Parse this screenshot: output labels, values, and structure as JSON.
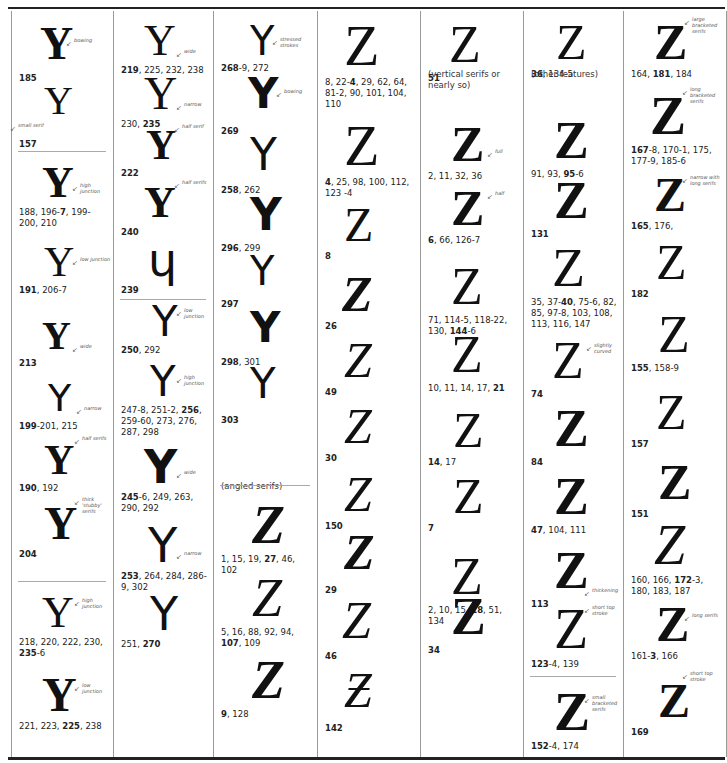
{
  "page": {
    "background": "#ffffff",
    "rule_color": "#222222",
    "column_divider_color": "#9a9a9a"
  },
  "columns": [
    {
      "id": "col1",
      "letter": "Y",
      "entries": [
        {
          "glyph": "Y",
          "note": "bowing",
          "refs": "**185**"
        },
        {
          "glyph": "Y",
          "note": "small serif",
          "refs": "**157**"
        },
        {
          "glyph": "Y",
          "note": "high junction",
          "refs": "188, 196-**7**, 199-200, 210"
        },
        {
          "glyph": "Y",
          "note": "low junction",
          "refs": "**191**, 206-7"
        },
        {
          "glyph": "Y",
          "note": "wide",
          "refs": "**213**"
        },
        {
          "glyph": "Y",
          "note": "narrow",
          "refs": "**199**-201, 215"
        },
        {
          "glyph": "Y",
          "note": "half serifs",
          "refs": "**190**, 192"
        },
        {
          "glyph": "Y",
          "note": "thick 'stubby' serifs",
          "refs": "**204**"
        },
        {
          "glyph": "Y",
          "note": "high junction",
          "refs": "218, 220, 222, 230, **235**-6"
        },
        {
          "glyph": "Y",
          "note": "low junction",
          "refs": "221, 223, **225**, 238"
        }
      ]
    },
    {
      "id": "col2",
      "letter": "Y",
      "entries": [
        {
          "glyph": "Y",
          "note": "wide",
          "refs": "**219**, 225, 232, 238"
        },
        {
          "glyph": "Y",
          "note": "narrow",
          "refs": "230, **235**"
        },
        {
          "glyph": "Y",
          "note": "half serif",
          "refs": "**222**"
        },
        {
          "glyph": "Y",
          "note": "half serifs",
          "refs": "**240**"
        },
        {
          "glyph": "ɥ",
          "note": "",
          "refs": "**239**"
        },
        {
          "glyph": "Y",
          "note": "low junction",
          "refs": "**250**, 292"
        },
        {
          "glyph": "Y",
          "note": "high junction",
          "refs": "247-8, 251-2, **256**, 259-60, 273, 276, 287, 298"
        },
        {
          "glyph": "Y",
          "note": "wide",
          "refs": "**245**-6, 249, 263, 290, 292"
        },
        {
          "glyph": "Y",
          "note": "narrow",
          "refs": "**253**, 264, 284, 286-9, 302"
        },
        {
          "glyph": "Y",
          "note": "",
          "refs": "251, **270**"
        }
      ]
    },
    {
      "id": "col3",
      "letter": "Y/Z",
      "entries": [
        {
          "glyph": "Y",
          "note": "stressed strokes",
          "refs": "**268**-9, 272"
        },
        {
          "glyph": "Y",
          "note": "bowing",
          "refs": "**269**"
        },
        {
          "glyph": "Y",
          "note": "",
          "refs": "**258**, 262"
        },
        {
          "glyph": "Y",
          "note": "",
          "refs": "**296**, 299"
        },
        {
          "glyph": "Y",
          "note": "",
          "refs": "**297**"
        },
        {
          "glyph": "Y",
          "note": "",
          "refs": "**298**, 301"
        },
        {
          "glyph": "Y",
          "note": "",
          "refs": "**303**"
        }
      ],
      "section_caption": "(angled serifs)",
      "entries_after": [
        {
          "glyph": "Z",
          "note": "",
          "refs": "1, 15, 19, **27**, 46, 102"
        },
        {
          "glyph": "Z",
          "note": "",
          "refs": "5, 16, 88, 92, 94, **107**, 109"
        },
        {
          "glyph": "Z",
          "note": "",
          "refs": "**9**, 128"
        }
      ]
    },
    {
      "id": "col4",
      "letter": "Z",
      "entries": [
        {
          "glyph": "Z",
          "note": "",
          "refs": "8, 22-**4**, 29, 62, 64, 81-2, 90, 101, 104, 110"
        },
        {
          "glyph": "Z",
          "note": "",
          "refs": "**4**, 25, 98, 100, 112, 123 -4"
        },
        {
          "glyph": "Z",
          "note": "",
          "refs": "**8**"
        },
        {
          "glyph": "Z",
          "note": "",
          "refs": "**26**"
        },
        {
          "glyph": "Z",
          "note": "",
          "refs": "**49**"
        },
        {
          "glyph": "Z",
          "note": "",
          "refs": "**30**"
        },
        {
          "glyph": "Z",
          "note": "",
          "refs": "**150**"
        },
        {
          "glyph": "Z",
          "note": "",
          "refs": "**29**"
        },
        {
          "glyph": "Z",
          "note": "",
          "refs": "**46**"
        },
        {
          "glyph": "Ƶ",
          "note": "",
          "refs": "**142**"
        }
      ]
    },
    {
      "id": "col5",
      "letter": "Z",
      "entries": [
        {
          "glyph": "Z",
          "note": "",
          "refs": "**51**"
        }
      ],
      "section_caption": "(vertical serifs or nearly so)",
      "entries_after": [
        {
          "glyph": "Z",
          "note": "full",
          "refs": "2, 11, 32, 36"
        },
        {
          "glyph": "Z",
          "note": "half",
          "refs": "**6**, 66, 126-7"
        },
        {
          "glyph": "Z",
          "note": "",
          "refs": "71, 114-5, 118-22, 130, **144**-6"
        },
        {
          "glyph": "Z",
          "note": "",
          "refs": "10, 11, 14, 17, **21**"
        },
        {
          "glyph": "Z",
          "note": "",
          "refs": "**14**, 17"
        },
        {
          "glyph": "Z",
          "note": "",
          "refs": "**7**"
        },
        {
          "glyph": "Z",
          "note": "",
          "refs": "2, 10, 15, **18**, 51, 134"
        },
        {
          "glyph": "Z",
          "note": "",
          "refs": "**34**"
        }
      ]
    },
    {
      "id": "col6",
      "letter": "Z",
      "entries": [
        {
          "glyph": "Z",
          "note": "",
          "refs": "**36**, 134-5"
        }
      ],
      "section_caption": "(other features)",
      "entries_after": [
        {
          "glyph": "Z",
          "note": "",
          "refs": "91, 93, **95**-6"
        },
        {
          "glyph": "Z",
          "note": "",
          "refs": "**131**"
        },
        {
          "glyph": "Z",
          "note": "",
          "refs": "35, 37-**40**, 75-6, 82, 85, 97-8, 103, 108, 113, 116, 147"
        },
        {
          "glyph": "Z",
          "note": "slightly curved",
          "refs": "**74**"
        },
        {
          "glyph": "Z",
          "note": "",
          "refs": "**84**"
        },
        {
          "glyph": "Z",
          "note": "",
          "refs": "**47**, 104, 111"
        },
        {
          "glyph": "Z",
          "note": "thickening",
          "refs": "**113**"
        },
        {
          "glyph": "Z",
          "note": "short top stroke",
          "refs": "**123**-4, 139"
        },
        {
          "glyph": "Z",
          "note": "small bracketed serifs",
          "refs": "**152**-4, 174"
        }
      ]
    },
    {
      "id": "col7",
      "letter": "Z",
      "entries": [
        {
          "glyph": "Z",
          "note": "large bracketed serifs",
          "refs": "164, **181**, 184"
        },
        {
          "glyph": "Z",
          "note": "long bracketed serifs",
          "refs": "**167**-8, 170-1, 175, 177-9, 185-6"
        },
        {
          "glyph": "Z",
          "note": "narrow with long serifs",
          "refs": "**165**, 176,"
        },
        {
          "glyph": "Z",
          "note": "",
          "refs": "**182**"
        },
        {
          "glyph": "Z",
          "note": "",
          "refs": "**155**, 158-9"
        },
        {
          "glyph": "Z",
          "note": "",
          "refs": "**157**"
        },
        {
          "glyph": "Z",
          "note": "",
          "refs": "**151**"
        },
        {
          "glyph": "Z",
          "note": "",
          "refs": "160, 166, **172**-3, 180, 183, 187"
        },
        {
          "glyph": "Z",
          "note": "long serifs",
          "refs": "161-**3**, 166"
        },
        {
          "glyph": "Z",
          "note": "short top stroke",
          "refs": "**169**"
        }
      ]
    }
  ]
}
